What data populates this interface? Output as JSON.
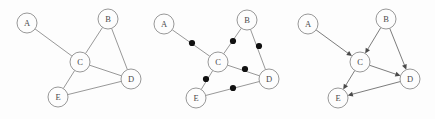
{
  "figure": {
    "width": 435,
    "height": 119,
    "background_color": "#fdfdfd",
    "node_stroke_color": "#8c8c8c",
    "edge_color": "#8c8c8c",
    "dot_color": "#111111",
    "arrow_color": "#4a4a4a",
    "label_color": "#4a4a4a",
    "node_radius": 10,
    "dot_radius": 3.1
  },
  "panels": [
    {
      "id": "panel-undirected",
      "name": "undirected-graph",
      "caption": "",
      "nodes": [
        {
          "id": "A",
          "label": "A",
          "x": 27,
          "y": 23
        },
        {
          "id": "B",
          "label": "B",
          "x": 108,
          "y": 19
        },
        {
          "id": "C",
          "label": "C",
          "x": 80,
          "y": 62
        },
        {
          "id": "D",
          "label": "D",
          "x": 131,
          "y": 79
        },
        {
          "id": "E",
          "label": "E",
          "x": 58,
          "y": 97
        }
      ],
      "edges": [
        {
          "from": "A",
          "to": "C",
          "directed": false,
          "midpoint_dot": false
        },
        {
          "from": "B",
          "to": "C",
          "directed": false,
          "midpoint_dot": false
        },
        {
          "from": "B",
          "to": "D",
          "directed": false,
          "midpoint_dot": false
        },
        {
          "from": "C",
          "to": "D",
          "directed": false,
          "midpoint_dot": false
        },
        {
          "from": "C",
          "to": "E",
          "directed": false,
          "midpoint_dot": false
        },
        {
          "from": "E",
          "to": "D",
          "directed": false,
          "midpoint_dot": false
        }
      ]
    },
    {
      "id": "panel-subdivided",
      "name": "subdivided-graph",
      "caption": "",
      "nodes": [
        {
          "id": "A",
          "label": "A",
          "x": 164,
          "y": 24
        },
        {
          "id": "B",
          "label": "B",
          "x": 247,
          "y": 20
        },
        {
          "id": "C",
          "label": "C",
          "x": 218,
          "y": 62
        },
        {
          "id": "D",
          "label": "D",
          "x": 269,
          "y": 79
        },
        {
          "id": "E",
          "label": "E",
          "x": 196,
          "y": 98
        }
      ],
      "edges": [
        {
          "from": "A",
          "to": "C",
          "directed": false,
          "midpoint_dot": true,
          "dot_x": 192,
          "dot_y": 43
        },
        {
          "from": "B",
          "to": "C",
          "directed": false,
          "midpoint_dot": true,
          "dot_x": 233,
          "dot_y": 41
        },
        {
          "from": "B",
          "to": "D",
          "directed": false,
          "midpoint_dot": true,
          "dot_x": 259,
          "dot_y": 46
        },
        {
          "from": "C",
          "to": "D",
          "directed": false,
          "midpoint_dot": true,
          "dot_x": 245,
          "dot_y": 69
        },
        {
          "from": "C",
          "to": "E",
          "directed": false,
          "midpoint_dot": true,
          "dot_x": 206,
          "dot_y": 79
        },
        {
          "from": "E",
          "to": "D",
          "directed": false,
          "midpoint_dot": true,
          "dot_x": 233,
          "dot_y": 88
        }
      ]
    },
    {
      "id": "panel-directed",
      "name": "directed-graph",
      "caption": "",
      "nodes": [
        {
          "id": "A",
          "label": "A",
          "x": 308,
          "y": 24
        },
        {
          "id": "B",
          "label": "B",
          "x": 386,
          "y": 19
        },
        {
          "id": "C",
          "label": "C",
          "x": 360,
          "y": 62
        },
        {
          "id": "D",
          "label": "D",
          "x": 410,
          "y": 79
        },
        {
          "id": "E",
          "label": "E",
          "x": 338,
          "y": 98
        }
      ],
      "edges": [
        {
          "from": "A",
          "to": "C",
          "directed": true,
          "midpoint_dot": false
        },
        {
          "from": "B",
          "to": "C",
          "directed": true,
          "midpoint_dot": false
        },
        {
          "from": "B",
          "to": "D",
          "directed": true,
          "midpoint_dot": false
        },
        {
          "from": "C",
          "to": "D",
          "directed": true,
          "midpoint_dot": false
        },
        {
          "from": "C",
          "to": "E",
          "directed": true,
          "midpoint_dot": false
        },
        {
          "from": "D",
          "to": "E",
          "directed": true,
          "midpoint_dot": false
        }
      ]
    }
  ]
}
